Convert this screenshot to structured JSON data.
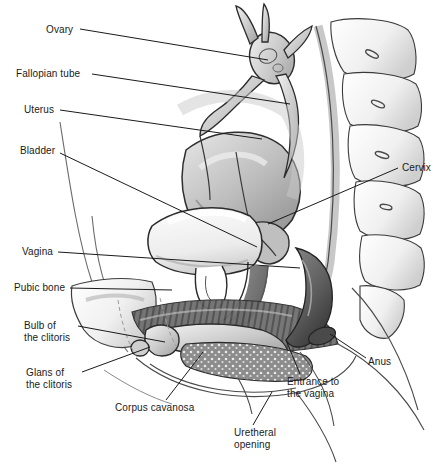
{
  "diagram": {
    "style": "grayscale pencil medical illustration",
    "background_color": "#ffffff",
    "line_color": "#1a1a1a",
    "text_color": "#1a1a1a",
    "labels": [
      {
        "id": "ovary",
        "text": "Ovary",
        "x": 46,
        "y": 24,
        "leader": [
          [
            80,
            29
          ],
          [
            268,
            60
          ]
        ]
      },
      {
        "id": "fallopian-tube",
        "text": "Fallopian tube",
        "x": 16,
        "y": 68,
        "leader": [
          [
            92,
            74
          ],
          [
            290,
            104
          ]
        ]
      },
      {
        "id": "uterus",
        "text": "Uterus",
        "x": 24,
        "y": 104,
        "leader": [
          [
            60,
            110
          ],
          [
            262,
            139
          ]
        ]
      },
      {
        "id": "bladder",
        "text": "Bladder",
        "x": 20,
        "y": 145,
        "leader": [
          [
            60,
            153
          ],
          [
            257,
            247
          ]
        ]
      },
      {
        "id": "vagina",
        "text": "Vagina",
        "x": 22,
        "y": 246,
        "leader": [
          [
            58,
            252
          ],
          [
            300,
            268
          ]
        ]
      },
      {
        "id": "pubic-bone",
        "text": "Pubic bone",
        "x": 14,
        "y": 282,
        "leader": [
          [
            70,
            288
          ],
          [
            172,
            290
          ]
        ]
      },
      {
        "id": "bulb-of-clitoris",
        "text": "Bulb of\nthe clitoris",
        "x": 24,
        "y": 320,
        "leader": [
          [
            78,
            326
          ],
          [
            165,
            342
          ]
        ]
      },
      {
        "id": "glans-of-clitoris",
        "text": "Glans of\nthe clitoris",
        "x": 26,
        "y": 367,
        "leader": [
          [
            82,
            372
          ],
          [
            150,
            347
          ]
        ]
      },
      {
        "id": "corpus-cavanosa",
        "text": "Corpus cavanosa",
        "x": 115,
        "y": 402,
        "leader": [
          [
            166,
            400
          ],
          [
            203,
            352
          ]
        ]
      },
      {
        "id": "cervix",
        "text": "Cervix",
        "x": 402,
        "y": 162,
        "leader": [
          [
            398,
            168
          ],
          [
            268,
            224
          ]
        ]
      },
      {
        "id": "anus",
        "text": "Anus",
        "x": 368,
        "y": 356,
        "leader": [
          [
            366,
            358
          ],
          [
            330,
            334
          ]
        ]
      },
      {
        "id": "entrance-vagina",
        "text": "Entrance to\nthe vagina",
        "x": 287,
        "y": 376,
        "leader": [
          [
            300,
            374
          ],
          [
            286,
            340
          ]
        ]
      },
      {
        "id": "uretheral-opening",
        "text": "Uretheral\nopening",
        "x": 234,
        "y": 427,
        "leader": [
          [
            253,
            425
          ],
          [
            272,
            392
          ]
        ]
      }
    ]
  }
}
